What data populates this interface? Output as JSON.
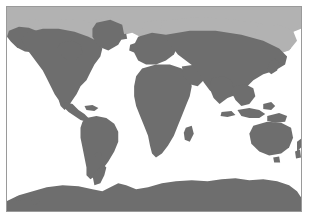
{
  "figure": {
    "caption": "",
    "projection": "equirectangular",
    "width_px": 310,
    "height_px": 221
  },
  "frame": {
    "border_color": "#9a9a9a",
    "background_color": "#ffffff",
    "left_px": 6,
    "top_px": 6,
    "width_px": 296,
    "height_px": 206
  },
  "legend": {
    "visible": false,
    "entries": [
      {
        "name": "land",
        "label": "Land",
        "color": "#6e6e6e"
      },
      {
        "name": "arctic",
        "label": "Northern / Arctic zone",
        "color": "#b2b2b2"
      },
      {
        "name": "ocean",
        "label": "Ocean",
        "color": "#ffffff"
      }
    ]
  },
  "regions": {
    "ocean": {
      "name": "ocean",
      "color": "#ffffff"
    },
    "land": {
      "name": "land",
      "color": "#6e6e6e"
    },
    "arctic_band": {
      "name": "arctic-band",
      "color": "#b2b2b2"
    },
    "antarctica": {
      "name": "antarctica",
      "color": "#6e6e6e"
    }
  },
  "labels": {
    "north_america": "North America",
    "south_america": "South America",
    "greenland": "Greenland",
    "europe": "Europe",
    "africa": "Africa",
    "asia": "Asia",
    "australia": "Australia",
    "antarctica": "Antarctica"
  },
  "axes": {
    "visible": false,
    "x_ticks": [],
    "y_ticks": []
  }
}
